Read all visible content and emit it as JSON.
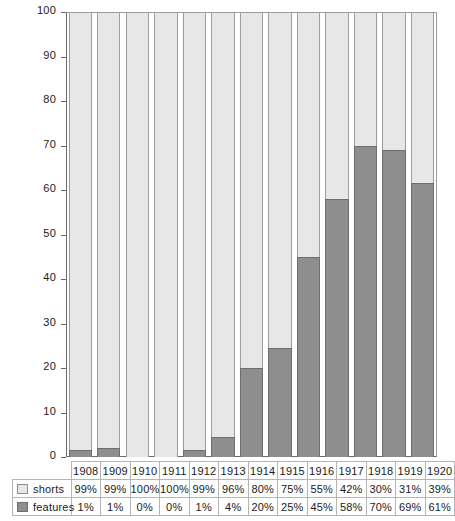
{
  "chart_data": {
    "type": "bar",
    "stacked": true,
    "title": "",
    "subtitle": "",
    "xlabel": "",
    "ylabel": "",
    "ylim": [
      0,
      100
    ],
    "yticks": [
      0,
      10,
      20,
      30,
      40,
      50,
      60,
      70,
      80,
      90,
      100
    ],
    "ytick_labels": [
      "0",
      "10",
      "20",
      "30",
      "40",
      "50",
      "60",
      "70",
      "80",
      "90",
      "100"
    ],
    "grid": false,
    "legend_position": "bottom-table",
    "categories": [
      "1908",
      "1909",
      "1910",
      "1911",
      "1912",
      "1913",
      "1914",
      "1915",
      "1916",
      "1917",
      "1918",
      "1919",
      "1920"
    ],
    "series": [
      {
        "name": "shorts",
        "color": "#e7e7e7",
        "labels": [
          "99%",
          "99%",
          "100%",
          "100%",
          "99%",
          "96%",
          "80%",
          "75%",
          "55%",
          "42%",
          "30%",
          "31%",
          "39%"
        ],
        "values": [
          98.5,
          98,
          100,
          100,
          98.5,
          95.5,
          80,
          75.5,
          55,
          42,
          30,
          31,
          38.5
        ]
      },
      {
        "name": "features",
        "color": "#8e8e8e",
        "labels": [
          "1%",
          "1%",
          "0%",
          "0%",
          "1%",
          "4%",
          "20%",
          "25%",
          "45%",
          "58%",
          "70%",
          "69%",
          "61%"
        ],
        "values": [
          1.5,
          2,
          0,
          0,
          1.5,
          4.5,
          20,
          24.5,
          45,
          58,
          70,
          69,
          61.5
        ]
      }
    ]
  },
  "table": {
    "year_row_blank": "",
    "legend_rows": [
      {
        "name": "shorts",
        "swatch": "shorts-swatch"
      },
      {
        "name": "features",
        "swatch": "features-swatch"
      }
    ]
  }
}
